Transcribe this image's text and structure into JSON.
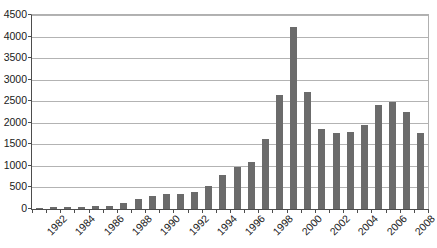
{
  "chart_data": {
    "type": "bar",
    "title": "",
    "xlabel": "",
    "ylabel": "",
    "ylim": [
      0,
      4500
    ],
    "ytick_step": 500,
    "yticks": [
      0,
      500,
      1000,
      1500,
      2000,
      2500,
      3000,
      3500,
      4000,
      4500
    ],
    "ytick_labels": [
      "0",
      "500",
      "1000",
      "1500",
      "2000",
      "2500",
      "3000",
      "3500",
      "4000",
      "4500"
    ],
    "grid": true,
    "legend": false,
    "bar_color": "#6b6b6b",
    "axis_color": "#4d4d4d",
    "gridline_color": "#b3b3b3",
    "categories": [
      "1982",
      "1983",
      "1984",
      "1985",
      "1986",
      "1987",
      "1988",
      "1989",
      "1990",
      "1991",
      "1992",
      "1993",
      "1994",
      "1995",
      "1996",
      "1997",
      "1998",
      "1999",
      "2000",
      "2001",
      "2002",
      "2003",
      "2004",
      "2005",
      "2006",
      "2007",
      "2008",
      "2009"
    ],
    "xtick_labels_shown": [
      "1982",
      "1984",
      "1986",
      "1988",
      "1990",
      "1992",
      "1994",
      "1996",
      "1998",
      "2000",
      "2002",
      "2004",
      "2006",
      "2008"
    ],
    "values": [
      20,
      55,
      45,
      45,
      75,
      80,
      150,
      230,
      295,
      350,
      350,
      400,
      530,
      780,
      970,
      1095,
      1615,
      2640,
      4230,
      2705,
      1865,
      1760,
      1790,
      1955,
      2420,
      2490,
      2255,
      1765
    ]
  }
}
